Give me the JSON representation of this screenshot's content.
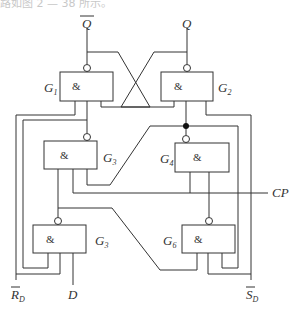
{
  "caption": "路如图 2 — 38 所示。",
  "signals": {
    "q_bar": "Q",
    "q": "Q",
    "cp": "CP",
    "rd_main": "R",
    "rd_sub": "D",
    "d": "D",
    "sd_main": "S",
    "sd_sub": "D"
  },
  "gates": [
    {
      "id": "G1",
      "main": "G",
      "sub": "1",
      "symbol": "&"
    },
    {
      "id": "G2",
      "main": "G",
      "sub": "2",
      "symbol": "&"
    },
    {
      "id": "G3",
      "main": "G",
      "sub": "3",
      "symbol": "&"
    },
    {
      "id": "G4",
      "main": "G",
      "sub": "4",
      "symbol": "&"
    },
    {
      "id": "G5",
      "main": "G",
      "sub": "3",
      "symbol": "&"
    },
    {
      "id": "G6",
      "main": "G",
      "sub": "6",
      "symbol": "&"
    }
  ],
  "colors": {
    "line": "#333333",
    "background": "#ffffff"
  }
}
